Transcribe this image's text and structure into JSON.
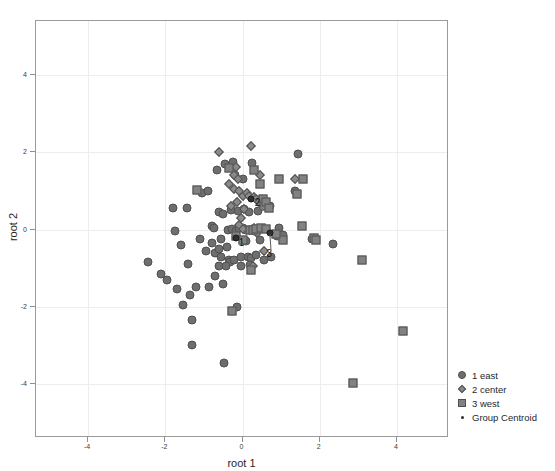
{
  "chart_data": {
    "type": "scatter",
    "title": "",
    "xlabel": "root 1",
    "ylabel": "root 2",
    "xlim": [
      -5.35,
      5.35
    ],
    "ylim": [
      -5.4,
      5.4
    ],
    "xticks": [
      -4,
      -2,
      0,
      2,
      4
    ],
    "yticks": [
      4,
      2,
      0,
      -2,
      -4
    ],
    "xticklabels": [
      "-4",
      "-2",
      "0",
      "2",
      "4"
    ],
    "yticklabels": [
      "4",
      "2",
      "0",
      "-2",
      "-4"
    ],
    "grid": true,
    "legend_position": "outside-bottom-right",
    "series": [
      {
        "name": "1 east",
        "marker": "circle",
        "color": "#6e6e6e",
        "points": [
          [
            -2.45,
            -0.85
          ],
          [
            -2.1,
            -1.15
          ],
          [
            -1.95,
            -1.3
          ],
          [
            -1.8,
            0.55
          ],
          [
            -1.75,
            -0.05
          ],
          [
            -1.7,
            -1.55
          ],
          [
            -1.6,
            -0.4
          ],
          [
            -1.55,
            -1.95
          ],
          [
            -1.45,
            0.55
          ],
          [
            -1.4,
            -0.9
          ],
          [
            -1.35,
            -1.7
          ],
          [
            -1.3,
            -2.35
          ],
          [
            -1.3,
            -3.0
          ],
          [
            -1.1,
            -0.25
          ],
          [
            -1.05,
            0.95
          ],
          [
            -0.95,
            -0.55
          ],
          [
            -0.9,
            1.0
          ],
          [
            -0.8,
            0.1
          ],
          [
            -0.8,
            -0.35
          ],
          [
            -0.75,
            0.05
          ],
          [
            -0.7,
            -0.6
          ],
          [
            -0.7,
            -1.2
          ],
          [
            -0.65,
            1.55
          ],
          [
            -0.6,
            0.45
          ],
          [
            -0.6,
            -0.5
          ],
          [
            -0.55,
            -0.25
          ],
          [
            -0.55,
            -0.7
          ],
          [
            -0.5,
            0.4
          ],
          [
            -0.5,
            -1.4
          ],
          [
            -0.48,
            -3.45
          ],
          [
            -0.45,
            1.7
          ],
          [
            -0.4,
            -0.45
          ],
          [
            -0.38,
            0.0
          ],
          [
            -0.35,
            -0.8
          ],
          [
            -0.32,
            -0.85
          ],
          [
            -0.3,
            0.5
          ],
          [
            -0.28,
            0.02
          ],
          [
            -0.25,
            1.75
          ],
          [
            -0.22,
            -0.78
          ],
          [
            -0.2,
            1.4
          ],
          [
            -0.18,
            -0.05
          ],
          [
            -0.15,
            -2.0
          ],
          [
            -0.12,
            0.48
          ],
          [
            -0.1,
            0.03
          ],
          [
            -0.05,
            -0.7
          ],
          [
            0.0,
            0.05
          ],
          [
            0.02,
            1.3
          ],
          [
            0.05,
            0.52
          ],
          [
            0.08,
            -0.3
          ],
          [
            0.1,
            0.0
          ],
          [
            0.15,
            -0.72
          ],
          [
            0.18,
            0.45
          ],
          [
            0.22,
            -0.75
          ],
          [
            0.25,
            1.72
          ],
          [
            0.3,
            -0.05
          ],
          [
            0.35,
            -0.65
          ],
          [
            0.4,
            0.48
          ],
          [
            0.45,
            -0.28
          ],
          [
            0.55,
            -0.8
          ],
          [
            0.62,
            0.6
          ],
          [
            0.7,
            0.62
          ],
          [
            0.75,
            -0.7
          ],
          [
            0.9,
            -0.18
          ],
          [
            0.95,
            0.05
          ],
          [
            1.05,
            -0.15
          ],
          [
            1.35,
            1.0
          ],
          [
            1.45,
            1.95
          ],
          [
            1.8,
            -0.25
          ],
          [
            2.35,
            -0.38
          ],
          [
            -0.62,
            -0.95
          ],
          [
            -0.42,
            -0.95
          ],
          [
            -0.05,
            -0.95
          ],
          [
            0.2,
            -0.92
          ],
          [
            -1.2,
            -1.48
          ],
          [
            -0.88,
            -1.5
          ]
        ]
      },
      {
        "name": "2 center",
        "marker": "diamond",
        "color": "#8a8a8a",
        "points": [
          [
            -0.62,
            2.0
          ],
          [
            0.22,
            2.15
          ],
          [
            -0.18,
            1.62
          ],
          [
            -0.22,
            1.42
          ],
          [
            -0.12,
            1.3
          ],
          [
            -0.22,
            1.05
          ],
          [
            -0.15,
            0.7
          ],
          [
            -0.08,
            1.0
          ],
          [
            0.0,
            0.88
          ],
          [
            0.05,
            0.52
          ],
          [
            0.12,
            0.95
          ],
          [
            0.18,
            0.88
          ],
          [
            0.3,
            0.85
          ],
          [
            0.35,
            0.78
          ],
          [
            0.42,
            0.72
          ],
          [
            -0.05,
            0.3
          ],
          [
            -0.1,
            0.12
          ],
          [
            0.02,
            0.02
          ],
          [
            0.3,
            0.05
          ],
          [
            0.38,
            -0.08
          ],
          [
            0.55,
            -0.55
          ],
          [
            0.28,
            -0.95
          ],
          [
            1.35,
            1.32
          ],
          [
            0.45,
            1.42
          ],
          [
            -0.3,
            0.6
          ],
          [
            -0.35,
            1.18
          ]
        ]
      },
      {
        "name": "3 west",
        "marker": "square",
        "color": "#828282",
        "points": [
          [
            -1.18,
            1.02
          ],
          [
            -0.35,
            1.58
          ],
          [
            0.3,
            1.55
          ],
          [
            0.45,
            1.18
          ],
          [
            0.52,
            0.8
          ],
          [
            0.55,
            0.62
          ],
          [
            0.6,
            0.7
          ],
          [
            0.68,
            0.55
          ],
          [
            0.2,
            0.0
          ],
          [
            0.28,
            -0.02
          ],
          [
            0.35,
            0.02
          ],
          [
            0.22,
            -1.05
          ],
          [
            -0.28,
            -2.12
          ],
          [
            0.95,
            1.32
          ],
          [
            1.4,
            0.92
          ],
          [
            1.58,
            1.32
          ],
          [
            1.55,
            0.1
          ],
          [
            1.85,
            -0.22
          ],
          [
            1.9,
            -0.28
          ],
          [
            1.05,
            -0.28
          ],
          [
            -0.18,
            -0.18
          ],
          [
            0.0,
            -0.28
          ],
          [
            0.88,
            -0.12
          ],
          [
            3.1,
            -0.78
          ],
          [
            4.15,
            -2.62
          ],
          [
            2.85,
            -3.98
          ],
          [
            0.48,
            0.05
          ],
          [
            0.62,
            0.02
          ]
        ]
      },
      {
        "name": "Group Centroid",
        "marker": "dot",
        "color": "#2f2f2f",
        "points": [
          [
            -0.18,
            -0.22
          ],
          [
            0.22,
            0.78
          ],
          [
            0.7,
            -0.08
          ]
        ],
        "labels": [
          "1",
          "2",
          "3"
        ]
      }
    ]
  },
  "legend": {
    "items": [
      {
        "label": "1 east",
        "marker": "circle"
      },
      {
        "label": "2 center",
        "marker": "diamond"
      },
      {
        "label": "3 west",
        "marker": "square"
      },
      {
        "label": "Group Centroid",
        "marker": "dot"
      }
    ]
  },
  "centroid_labels": [
    {
      "text": "1",
      "x": -0.1,
      "y": -0.32,
      "leader": false
    },
    {
      "text": "2",
      "x": 0.32,
      "y": 0.72,
      "leader": false
    },
    {
      "text": "3",
      "x": 0.62,
      "y": -0.62,
      "leader": true,
      "to_x": 0.72,
      "to_y": -0.12
    }
  ]
}
